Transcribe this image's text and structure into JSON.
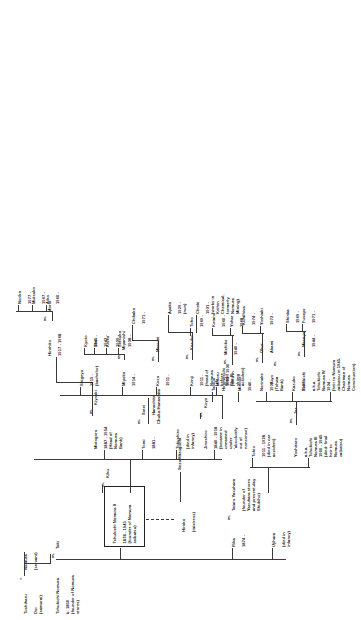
{
  "document": {
    "kind": "genealogy-chart",
    "title": "Nomura Family Tree",
    "orientation": "rotated-90-ccw"
  },
  "captions": [
    {
      "id": "chuko",
      "text": "Chuko Hanashita"
    },
    {
      "id": "sezo",
      "text": "Sezo Mizoguchi"
    }
  ],
  "marriage_marks": [
    {
      "id": "m-root",
      "text": "="
    },
    {
      "id": "m-taki",
      "text": "m."
    },
    {
      "id": "m-kiku",
      "text": "m."
    },
    {
      "id": "m-rika",
      "text": "m."
    },
    {
      "id": "m-koyo",
      "text": "m."
    },
    {
      "id": "m-sotei",
      "text": "m."
    },
    {
      "id": "m-kazuko",
      "text": "m."
    },
    {
      "id": "m-masumi",
      "text": "m."
    },
    {
      "id": "m-kiyoaki",
      "text": "m."
    },
    {
      "id": "m-norinake",
      "text": "m."
    },
    {
      "id": "m-tatsuo",
      "text": "m."
    },
    {
      "id": "m-jar",
      "text": "m."
    },
    {
      "id": "m-kiyo",
      "text": "m."
    },
    {
      "id": "m-minoyo",
      "text": "m."
    },
    {
      "id": "m-mariyoko",
      "text": "m."
    }
  ],
  "nodes": [
    {
      "id": "toshi-hara",
      "name": "Toshiharu",
      "detail": "Doi\n(samurai)",
      "boxed": false
    },
    {
      "id": "nomura-servant",
      "name": "Nomura",
      "detail": "(servant)",
      "boxed": false
    },
    {
      "id": "tchukichi-1",
      "name": "Tchukichi Nomura",
      "detail": "b. 1850\n(founder of Nomura stores)",
      "boxed": false
    },
    {
      "id": "taki",
      "name": "Taki",
      "detail": "",
      "boxed": false
    },
    {
      "id": "tchukichi-2",
      "name": "Tchukichi Nomura II",
      "detail": "1878 - 1945\n(founder of Nomura zaibatsu)",
      "boxed": true
    },
    {
      "id": "kiku",
      "name": "Kiku",
      "detail": "",
      "boxed": false
    },
    {
      "id": "hiroko",
      "name": "Hiroko",
      "detail": "(mistress)",
      "boxed": false
    },
    {
      "id": "ujihara",
      "name": "Ujihara",
      "detail": "(died in\ninfancy)",
      "boxed": false
    },
    {
      "id": "rika",
      "name": "Rika",
      "detail": "1874 -",
      "boxed": false
    },
    {
      "id": "tataro",
      "name": "Tataro Yasuhara",
      "detail": "(founder of\nYasuhara stores\nand present-day\nShukiho)",
      "boxed": false
    },
    {
      "id": "fumikichi",
      "name": "Fumikichi",
      "detail": "a.k.a.\nTchukichi\nNomura IV\n1934 -\n(heir to Nomura\nzaibatsu in 1945,\nChairman of\nNomura\nConstruction)",
      "boxed": false
    },
    {
      "id": "jinoshiro",
      "name": "Jinoshiro",
      "detail": "1840 - 1918\n(became in\nunnamed\nunder\n'absolutely\nout of\nnonsense)",
      "boxed": false
    },
    {
      "id": "koyo",
      "name": "Koyo",
      "detail": "",
      "boxed": false
    },
    {
      "id": "tokushiro",
      "name": "Tokushiro",
      "detail": "(died in\ninfancy)",
      "boxed": false
    },
    {
      "id": "tomi",
      "name": "Tomi",
      "detail": "1881 -",
      "boxed": false
    },
    {
      "id": "sotei",
      "name": "Sotei",
      "detail": "Hanashita",
      "boxed": false
    },
    {
      "id": "motogoro",
      "name": "Motogoro",
      "detail": "1887 - 1954\n(Head of\nNomura\nBank)",
      "boxed": false
    },
    {
      "id": "kiyoaki",
      "name": "Kiyoaki",
      "detail": "",
      "boxed": false
    },
    {
      "id": "minoru",
      "name": "Minoru",
      "detail": "1908 - 1930\n(died in\nskiing\naccident)",
      "boxed": false
    },
    {
      "id": "kenji",
      "name": "Kenji",
      "detail": "1911 -\n(head of\nNomura\nLife\nbefore\nWorld\nWar II)",
      "boxed": false
    },
    {
      "id": "kazuko",
      "name": "Kazuko",
      "detail": "",
      "boxed": false
    },
    {
      "id": "kozo",
      "name": "Kozo",
      "detail": "1911 -",
      "boxed": false
    },
    {
      "id": "masumi",
      "name": "Masumi",
      "detail": "",
      "boxed": false
    },
    {
      "id": "miyoko",
      "name": "Miyoko",
      "detail": "1914 -",
      "boxed": false
    },
    {
      "id": "miyanishi",
      "name": "Miyanishi",
      "detail": "",
      "boxed": false
    },
    {
      "id": "shigeyo",
      "name": "Shigeyo",
      "detail": "1915 -\n(bachelor)",
      "boxed": false
    },
    {
      "id": "hirohito",
      "name": "Hirohito",
      "detail": "1917 - 1968",
      "boxed": false
    },
    {
      "id": "morio",
      "name": "Morio",
      "detail": "",
      "boxed": false
    },
    {
      "id": "tohio",
      "name": "Tohio",
      "detail": "1911 - 1928\n(died in car\naccident)",
      "boxed": false
    },
    {
      "id": "yoshitaro",
      "name": "Yoshitaro",
      "detail": "a.k.a.\nTchukichi\nNomura III\n1900 - 1945\n(died: final\nheir to\nNomura\nzaibatsu)",
      "boxed": false
    },
    {
      "id": "jar",
      "name": "Jar",
      "detail": "",
      "boxed": false
    },
    {
      "id": "ayako",
      "name": "Ayako",
      "detail": "1929 -\n(nun)",
      "boxed": false
    },
    {
      "id": "chieki",
      "name": "Chieki",
      "detail": "1931 -\n(works in\nKeihin\nChemical,\nformerly\nNomura\nMining)",
      "boxed": false
    },
    {
      "id": "kazuko-2",
      "name": "Kazuko",
      "detail": "1937 -",
      "boxed": false
    },
    {
      "id": "kiyo",
      "name": "Kiyo",
      "detail": "",
      "boxed": false
    },
    {
      "id": "norinake",
      "name": "Norinake",
      "detail": "1932 -\n(Tohwa\nBank)",
      "boxed": false
    },
    {
      "id": "okur",
      "name": "Okur",
      "detail": "Akami",
      "boxed": false
    },
    {
      "id": "minoyo",
      "name": "Minoyo",
      "detail": "1940 -",
      "boxed": false
    },
    {
      "id": "michiko",
      "name": "Michiko",
      "detail": "1940 -",
      "boxed": false
    },
    {
      "id": "tatsuo",
      "name": "Tatsuo",
      "detail": "Hiromitsuhi",
      "boxed": false
    },
    {
      "id": "setsuko",
      "name": "Setsuko",
      "detail": "1938 -",
      "boxed": false
    },
    {
      "id": "keiko",
      "name": "Keiko",
      "detail": "1939 -",
      "boxed": false
    },
    {
      "id": "sho",
      "name": "Sho",
      "detail": "1942 -",
      "boxed": false
    },
    {
      "id": "kyoto",
      "name": "Kyoto",
      "detail": "1945 -",
      "boxed": false
    },
    {
      "id": "masayo",
      "name": "Masayo",
      "detail": "1944 -",
      "boxed": false
    },
    {
      "id": "fusayo",
      "name": "Fusayo",
      "detail": "1971 -",
      "boxed": false
    },
    {
      "id": "shinka",
      "name": "Shinka",
      "detail": "1969 -",
      "boxed": false
    },
    {
      "id": "yohar",
      "name": "Yohar",
      "detail": "1968 -",
      "boxed": false
    },
    {
      "id": "kotaro",
      "name": "Kotaro",
      "detail": "1960 -",
      "boxed": false
    },
    {
      "id": "toho",
      "name": "Toho",
      "detail": "1969 -",
      "boxed": false
    },
    {
      "id": "yoshiaki",
      "name": "Yoshiaki",
      "detail": "1972 -",
      "boxed": false
    },
    {
      "id": "kumihisa",
      "name": "Kumihisa",
      "detail": "1974 -",
      "boxed": false
    },
    {
      "id": "noriko",
      "name": "Noriko",
      "detail": "1977 -",
      "boxed": false
    },
    {
      "id": "chikako",
      "name": "Chikako",
      "detail": "1971 -",
      "boxed": false
    },
    {
      "id": "mutsuko",
      "name": "Mutsuko",
      "detail": "1967 -",
      "boxed": false
    },
    {
      "id": "aiko",
      "name": "Aiko",
      "detail": "1960 -",
      "boxed": false
    },
    {
      "id": "kiriko",
      "name": "Kiriko",
      "detail": "1957 -",
      "boxed": false
    }
  ]
}
